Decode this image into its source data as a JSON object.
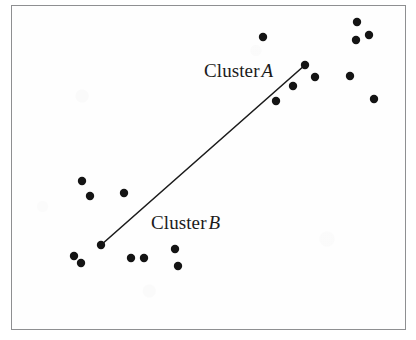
{
  "figure": {
    "background_color": "#ffffff",
    "frame_color": "#8e8f91",
    "ink_color": "#1b1b1b"
  },
  "annotations": {
    "cluster_a": {
      "prefix": "Cluster",
      "letter": "A"
    },
    "cluster_b": {
      "prefix": "Cluster",
      "letter": "B"
    }
  },
  "chart_data": {
    "type": "scatter",
    "title": "",
    "xlabel": "",
    "ylabel": "",
    "xlim": [
      11,
      406
    ],
    "ylim": [
      5,
      330
    ],
    "grid": false,
    "legend": "none",
    "axis_ticks": "none",
    "marker_color": "#141414",
    "marker_radius": 4.2,
    "points": [
      {
        "x": 263,
        "y": 37
      },
      {
        "x": 357,
        "y": 22
      },
      {
        "x": 356,
        "y": 40
      },
      {
        "x": 369,
        "y": 35
      },
      {
        "x": 305,
        "y": 65
      },
      {
        "x": 315,
        "y": 77
      },
      {
        "x": 293,
        "y": 86
      },
      {
        "x": 276,
        "y": 101
      },
      {
        "x": 350,
        "y": 76
      },
      {
        "x": 374,
        "y": 99
      },
      {
        "x": 82,
        "y": 181
      },
      {
        "x": 90,
        "y": 196
      },
      {
        "x": 124,
        "y": 193
      },
      {
        "x": 101,
        "y": 245
      },
      {
        "x": 74,
        "y": 256
      },
      {
        "x": 81,
        "y": 263
      },
      {
        "x": 131,
        "y": 258
      },
      {
        "x": 144,
        "y": 258
      },
      {
        "x": 175,
        "y": 249
      },
      {
        "x": 178,
        "y": 266
      }
    ],
    "connector_line": {
      "label": "cluster-distance-line",
      "color": "#1b1b1b",
      "width": 1.6,
      "from": {
        "x": 101,
        "y": 245
      },
      "to": {
        "x": 305,
        "y": 65
      }
    }
  }
}
